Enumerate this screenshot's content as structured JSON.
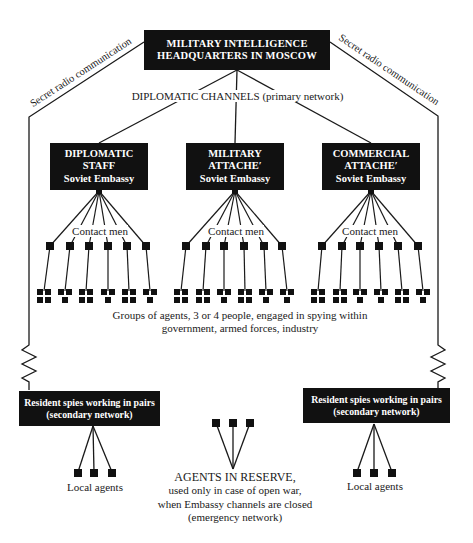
{
  "headquarters": {
    "line1": "MILITARY INTELLIGENCE",
    "line2": "HEADQUARTERS IN MOSCOW"
  },
  "primary_channel_label": "DIPLOMATIC CHANNELS (primary network)",
  "radio_links": {
    "left": "Secret radio communication",
    "right": "Secret radio communication"
  },
  "embassy_offices": [
    {
      "line1": "DIPLOMATIC",
      "line2": "STAFF",
      "line3": "Soviet Embassy",
      "contact_label": "Contact men",
      "contact_count": 6,
      "agent_group_sizes": [
        4,
        3,
        4,
        3,
        4,
        3
      ]
    },
    {
      "line1": "MILITARY",
      "line2": "ATTACHE′",
      "line3": "Soviet Embassy",
      "contact_label": "Contact men",
      "contact_count": 6,
      "agent_group_sizes": [
        4,
        4,
        3,
        4,
        3,
        3
      ]
    },
    {
      "line1": "COMMERCIAL",
      "line2": "ATTACHE′",
      "line3": "Soviet Embassy",
      "contact_label": "Contact men",
      "contact_count": 6,
      "agent_group_sizes": [
        4,
        4,
        3,
        3,
        4,
        3
      ]
    }
  ],
  "agent_groups_caption": {
    "line1": "Groups of agents, 3 or 4 people, engaged in spying within",
    "line2": "government, armed forces, industry"
  },
  "resident_spies": [
    {
      "line1": "Resident spies working in pairs",
      "line2": "(secondary network)",
      "local_agents_label": "Local agents",
      "local_agent_count": 3
    },
    {
      "line1": "Resident spies working in pairs",
      "line2": "(secondary network)",
      "local_agents_label": "Local agents",
      "local_agent_count": 3
    }
  ],
  "reserve": {
    "title": "AGENTS IN RESERVE,",
    "line2": "used only in case of open war,",
    "line3": "when Embassy channels are closed",
    "line4": "(emergency network)",
    "agent_count": 3
  },
  "colors": {
    "box_fill": "#111111",
    "box_text": "#ffffff",
    "line": "#1a1a1a",
    "background": "#ffffff"
  }
}
